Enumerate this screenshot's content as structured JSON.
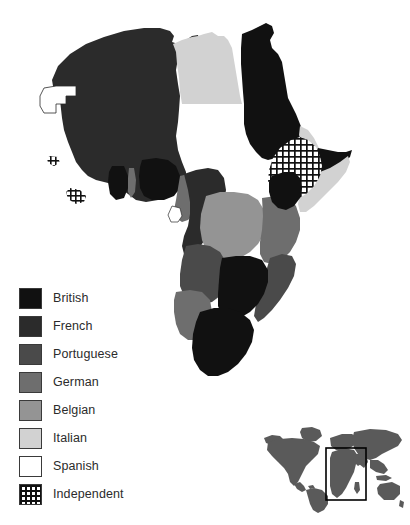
{
  "map": {
    "title": "Colonial Africa",
    "region": "Africa",
    "background_color": "#ffffff",
    "legend": {
      "name": "colonial-power-legend",
      "items": [
        {
          "label": "British",
          "color": "#111111",
          "pattern": "solid"
        },
        {
          "label": "French",
          "color": "#2b2b2b",
          "pattern": "solid"
        },
        {
          "label": "Portuguese",
          "color": "#4a4a4a",
          "pattern": "solid"
        },
        {
          "label": "German",
          "color": "#6e6e6e",
          "pattern": "solid"
        },
        {
          "label": "Belgian",
          "color": "#949494",
          "pattern": "solid"
        },
        {
          "label": "Italian",
          "color": "#d2d2d2",
          "pattern": "solid"
        },
        {
          "label": "Spanish",
          "color": "#ffffff",
          "pattern": "solid"
        },
        {
          "label": "Independent",
          "color": "#ffffff",
          "pattern": "crosshatch"
        }
      ]
    },
    "territories": [
      {
        "name": "Spanish Sahara",
        "power": "Spanish"
      },
      {
        "name": "French West Africa",
        "power": "French"
      },
      {
        "name": "French Equatorial Africa",
        "power": "French"
      },
      {
        "name": "Algeria",
        "power": "French"
      },
      {
        "name": "Tunisia",
        "power": "French"
      },
      {
        "name": "Libya",
        "power": "Italian"
      },
      {
        "name": "Egypt",
        "power": "British"
      },
      {
        "name": "Anglo-Egyptian Sudan",
        "power": "British"
      },
      {
        "name": "Eritrea",
        "power": "Italian"
      },
      {
        "name": "Italian Somaliland",
        "power": "Italian"
      },
      {
        "name": "Abyssinia",
        "power": "Independent"
      },
      {
        "name": "Liberia",
        "power": "Independent"
      },
      {
        "name": "Gold Coast",
        "power": "British"
      },
      {
        "name": "Nigeria",
        "power": "British"
      },
      {
        "name": "Sierra Leone",
        "power": "British"
      },
      {
        "name": "Kamerun",
        "power": "German"
      },
      {
        "name": "Togoland",
        "power": "German"
      },
      {
        "name": "Spanish Guinea",
        "power": "Spanish"
      },
      {
        "name": "Belgian Congo",
        "power": "Belgian"
      },
      {
        "name": "Angola",
        "power": "Portuguese"
      },
      {
        "name": "Mozambique",
        "power": "Portuguese"
      },
      {
        "name": "German East Africa",
        "power": "German"
      },
      {
        "name": "German South West Africa",
        "power": "German"
      },
      {
        "name": "British East Africa",
        "power": "British"
      },
      {
        "name": "Rhodesia",
        "power": "British"
      },
      {
        "name": "Union of South Africa",
        "power": "British"
      },
      {
        "name": "Bechuanaland",
        "power": "British"
      }
    ]
  },
  "inset": {
    "name": "world-locator-map",
    "land_color": "#5a5a5a",
    "highlight_box_color": "#000000",
    "highlight_region": "Africa"
  }
}
